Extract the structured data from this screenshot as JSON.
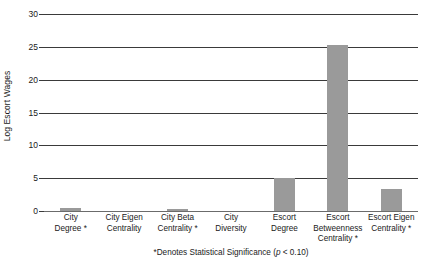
{
  "chart_data": {
    "type": "bar",
    "title": "",
    "xlabel": "",
    "ylabel": "Log Escort Wages",
    "ylim": [
      0,
      30
    ],
    "yticks": [
      0,
      5,
      10,
      15,
      20,
      25,
      30
    ],
    "ytick_labels": [
      "0",
      "5",
      "10",
      "15",
      "20",
      "25",
      "30"
    ],
    "grid": true,
    "legend": "none",
    "bar_color": "#9a9a9a",
    "categories": [
      "City Degree *",
      "City Eigen Centrality",
      "City Beta Centrality *",
      "City Diversity",
      "Escort Degree",
      "Escort Betweenness Centrality *",
      "Escort Eigen Centrality *"
    ],
    "category_lines": [
      [
        "City",
        "Degree *"
      ],
      [
        "City Eigen",
        "Centrality"
      ],
      [
        "City Beta",
        "Centrality *"
      ],
      [
        "City",
        "Diversity"
      ],
      [
        "Escort",
        "Degree"
      ],
      [
        "Escort",
        "Betweenness",
        "Centrality *"
      ],
      [
        "Escort Eigen",
        "Centrality *"
      ]
    ],
    "values": [
      0.5,
      0,
      0.35,
      0,
      5.0,
      25.3,
      3.3
    ],
    "annotation": "*Denotes Statistical Significance (p < 0.10)",
    "annotation_parts": {
      "before": "*Denotes Statistical Significance (",
      "italic": "p",
      "after": " < 0.10)"
    }
  }
}
